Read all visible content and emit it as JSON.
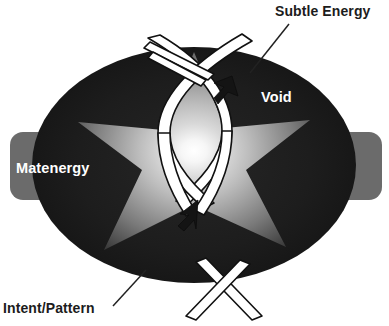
{
  "diagram": {
    "labels": {
      "subtle_energy": "Subtle Energy",
      "void": "Void",
      "matenergy": "Matenergy",
      "intent_pattern": "Intent/Pattern"
    },
    "shapes": {
      "ellipse_name": "void-ellipse",
      "star_name": "radiant-star",
      "helix_name": "double-helix-ribbon",
      "left_tab_name": "matenergy-tab",
      "right_tab_name": "right-tab"
    },
    "colors": {
      "background": "#ffffff",
      "ellipse_fill": "#1b1b1b",
      "tab_fill": "#6b6b6b",
      "star_light": "#f2f2f2",
      "star_mid": "#9a9a9a",
      "star_dark": "#3a3a3a",
      "label_dark": "#1c1c1c",
      "label_light": "#ffffff",
      "ribbon_fill": "#ffffff",
      "ribbon_stroke": "#111111",
      "leader_line": "#222222",
      "arrow_fill": "#141414"
    },
    "leaders": [
      {
        "name": "leader-subtle-energy",
        "from": "Subtle Energy",
        "to": "void-ellipse"
      },
      {
        "name": "leader-intent-pattern",
        "from": "Intent/Pattern",
        "to": "helix-base"
      }
    ],
    "arrows": [
      {
        "name": "arrow-void-inward",
        "direction": "down-left"
      },
      {
        "name": "arrow-intent-upward",
        "direction": "up-right"
      }
    ]
  }
}
